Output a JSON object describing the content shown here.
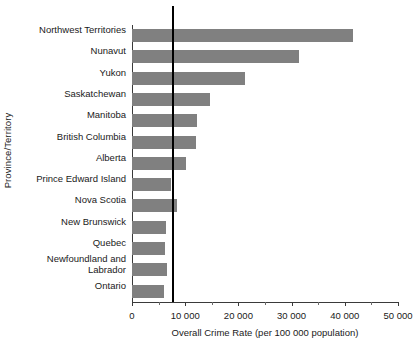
{
  "chart_data": {
    "type": "bar",
    "orientation": "horizontal",
    "title": "",
    "xlabel": "Overall Crime Rate (per 100 000 population)",
    "ylabel": "Province/Territory",
    "xlim": [
      0,
      50000
    ],
    "grid": false,
    "legend": null,
    "bar_color": "#808080",
    "axis_color": "#3a3a3a",
    "reference_line": {
      "label": "National (7518)",
      "name": "National",
      "value": 7518,
      "color": "#000000"
    },
    "xticks": [
      0,
      10000,
      20000,
      30000,
      40000,
      50000
    ],
    "xtick_labels": [
      "0",
      "10 000",
      "20 000",
      "30 000",
      "40 000",
      "50 000"
    ],
    "xticks_minor": [
      5000,
      15000,
      25000,
      35000,
      45000
    ],
    "categories": [
      "Northwest Territories",
      "Nunavut",
      "Yukon",
      "Saskatchewan",
      "Manitoba",
      "British Columbia",
      "Alberta",
      "Prince Edward Island",
      "Nova Scotia",
      "New Brunswick",
      "Quebec",
      "Newfoundland and\nLabrador",
      "Ontario"
    ],
    "values": [
      41500,
      31400,
      21200,
      14700,
      12200,
      12000,
      10100,
      7300,
      8450,
      6400,
      6200,
      6550,
      6000
    ]
  }
}
